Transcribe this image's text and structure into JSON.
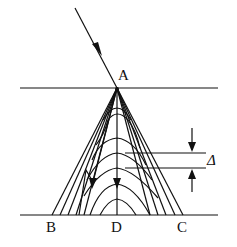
{
  "diagram": {
    "type": "ray-optics / wave interference diagram",
    "labels": {
      "A_top": "A",
      "B": "B",
      "D": "D",
      "C": "C",
      "delta": "Δ"
    },
    "colors": {
      "stroke": "#111111",
      "background": "#ffffff"
    },
    "elements": {
      "top_surface": {
        "y": 88,
        "x1": 20,
        "x2": 218
      },
      "bottom_surface": {
        "y": 215,
        "x1": 20,
        "x2": 218
      },
      "incident_ray": {
        "from": [
          75,
          8
        ],
        "to": [
          117,
          88
        ]
      },
      "apex_A": [
        117,
        88
      ],
      "fan_endpoints_x": [
        52,
        60,
        68,
        76,
        84,
        93,
        102,
        117,
        133,
        141,
        150,
        158,
        166,
        175,
        183
      ],
      "curve_peaks_y": [
        108,
        123,
        138,
        153,
        168,
        184,
        200
      ],
      "delta_lines_y": [
        153,
        168
      ],
      "delta_lines_x": [
        125,
        206
      ]
    }
  }
}
